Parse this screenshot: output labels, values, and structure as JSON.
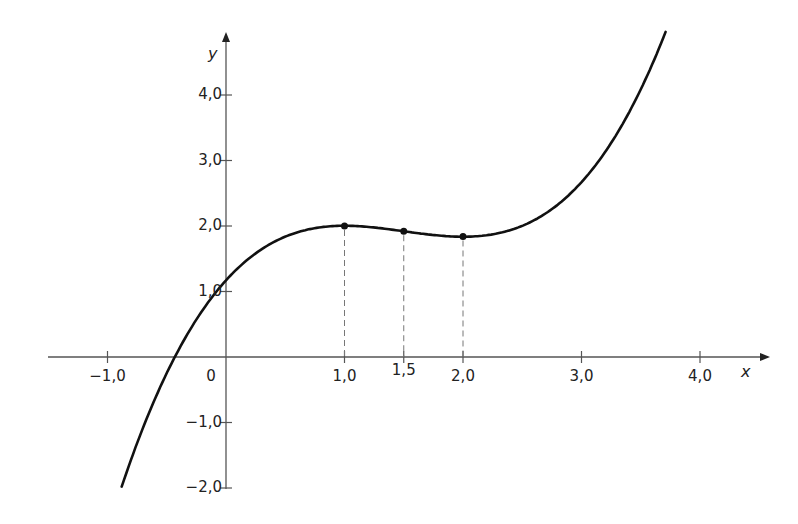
{
  "chart_data": {
    "type": "line",
    "title": "",
    "xlabel": "x",
    "ylabel": "y",
    "xlim": [
      -1.5,
      4.6
    ],
    "ylim": [
      -2.1,
      4.9
    ],
    "grid": false,
    "legend": null,
    "x_ticks": [
      {
        "value": -1.0,
        "label": "−1,0"
      },
      {
        "value": 1.0,
        "label": "1,0"
      },
      {
        "value": 1.5,
        "label": "1,5"
      },
      {
        "value": 2.0,
        "label": "2,0"
      },
      {
        "value": 3.0,
        "label": "3,0"
      },
      {
        "value": 4.0,
        "label": "4,0"
      }
    ],
    "y_ticks": [
      {
        "value": 4.0,
        "label": "4,0"
      },
      {
        "value": 3.0,
        "label": "3,0"
      },
      {
        "value": 2.0,
        "label": "2,0"
      },
      {
        "value": 1.0,
        "label": "1,0"
      },
      {
        "value": -1.0,
        "label": "−1,0"
      },
      {
        "value": -2.0,
        "label": "−2,0"
      }
    ],
    "origin_label": "0",
    "series": [
      {
        "name": "f(x)",
        "kind": "cubic curve",
        "x_range": [
          -0.88,
          3.71
        ],
        "sampled_points": {
          "x": [
            -0.88,
            -0.5,
            -0.36,
            0.0,
            0.5,
            1.0,
            1.5,
            2.0,
            2.5,
            3.0,
            3.5,
            3.71
          ],
          "y": [
            -1.98,
            -0.29,
            0.0,
            1.17,
            1.63,
            2.0,
            1.92,
            1.84,
            1.92,
            2.67,
            3.79,
            4.98
          ]
        }
      }
    ],
    "marked_points": [
      {
        "x": 1.0,
        "y": 2.0,
        "note": "local maximum"
      },
      {
        "x": 1.5,
        "y": 1.92,
        "note": "inflection point"
      },
      {
        "x": 2.0,
        "y": 1.84,
        "note": "local minimum"
      }
    ],
    "annotations": [
      "dashed vertical lines from marked points down to x-axis at x = 1,0, 1,5, 2,0"
    ]
  },
  "pixel_map": {
    "origin_px": [
      226,
      357
    ],
    "px_per_unit_x": 118.5,
    "px_per_unit_y": 65.5
  },
  "curve_model": {
    "a": 0.3333,
    "b": -1.5,
    "c": 2.0,
    "d": 1.17
  }
}
